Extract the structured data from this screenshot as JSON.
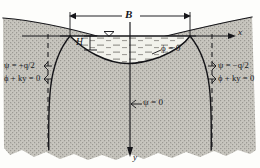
{
  "figure": {
    "name": "seepage-flow-net-boundary-conditions",
    "type": "engineering-cross-section-diagram"
  },
  "axes": {
    "x_label": "x",
    "y_label": "y",
    "origin_note": "origin at centre of water surface, x positive to the right, y positive downward"
  },
  "dimensions": {
    "width_label": "B",
    "depth_label": "H"
  },
  "labels": {
    "phi_zero_surface": "ϕ = 0",
    "psi_zero_center": "ψ = 0",
    "psi_left": "ψ = +q/2",
    "phi_left": "ϕ + ky = 0",
    "psi_right": "ψ = −q/2",
    "phi_right": "ϕ + ky = 0"
  },
  "symbols": {
    "water_table": "▽",
    "arrow_left": "←",
    "arrow_right": "→",
    "arrow_down": "↓"
  },
  "colors": {
    "ink": "#16161a",
    "soil_fill": "#c9c7c0",
    "soil_fill_dark": "#b9b7b0",
    "water_fill": "#efefe9",
    "paper": "#fdfdfb",
    "dash": "#1d1d20"
  }
}
